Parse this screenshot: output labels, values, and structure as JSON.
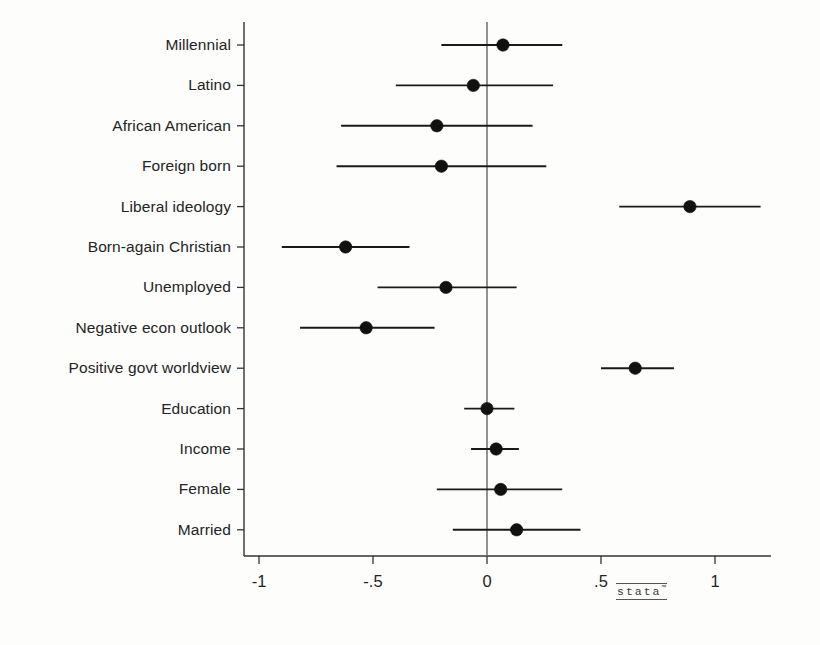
{
  "chart_data": {
    "type": "scatter",
    "subtype": "coefficient-plot-with-confidence-intervals",
    "title": "",
    "subtitle": "",
    "xlabel": "",
    "ylabel": "",
    "xlim": [
      -1.12,
      1.22
    ],
    "xticks": [
      -1,
      -0.5,
      0,
      0.5,
      1
    ],
    "xtick_labels": [
      "-1",
      "-.5",
      "0",
      ".5",
      "1"
    ],
    "grid": false,
    "legend": null,
    "reference_line": 0,
    "categories": [
      "Millennial",
      "Latino",
      "African American",
      "Foreign born",
      "Liberal ideology",
      "Born-again Christian",
      "Unemployed",
      "Negative econ outlook",
      "Positive govt worldview",
      "Education",
      "Income",
      "Female",
      "Married"
    ],
    "estimates": [
      0.07,
      -0.06,
      -0.22,
      -0.2,
      0.89,
      -0.62,
      -0.18,
      -0.53,
      0.65,
      0.0,
      0.04,
      0.06,
      0.13
    ],
    "ci_low": [
      -0.2,
      -0.4,
      -0.64,
      -0.66,
      0.58,
      -0.9,
      -0.48,
      -0.82,
      0.5,
      -0.1,
      -0.07,
      -0.22,
      -0.15
    ],
    "ci_high": [
      0.33,
      0.29,
      0.2,
      0.26,
      1.2,
      -0.34,
      0.13,
      -0.23,
      0.82,
      0.12,
      0.14,
      0.33,
      0.41
    ],
    "points": [
      {
        "label": "Millennial",
        "estimate": 0.07,
        "ci_low": -0.2,
        "ci_high": 0.33
      },
      {
        "label": "Latino",
        "estimate": -0.06,
        "ci_low": -0.4,
        "ci_high": 0.29
      },
      {
        "label": "African American",
        "estimate": -0.22,
        "ci_low": -0.64,
        "ci_high": 0.2
      },
      {
        "label": "Foreign born",
        "estimate": -0.2,
        "ci_low": -0.66,
        "ci_high": 0.26
      },
      {
        "label": "Liberal ideology",
        "estimate": 0.89,
        "ci_low": 0.58,
        "ci_high": 1.2
      },
      {
        "label": "Born-again Christian",
        "estimate": -0.62,
        "ci_low": -0.9,
        "ci_high": -0.34
      },
      {
        "label": "Unemployed",
        "estimate": -0.18,
        "ci_low": -0.48,
        "ci_high": 0.13
      },
      {
        "label": "Negative econ outlook",
        "estimate": -0.53,
        "ci_low": -0.82,
        "ci_high": -0.23
      },
      {
        "label": "Positive govt worldview",
        "estimate": 0.65,
        "ci_low": 0.5,
        "ci_high": 0.82
      },
      {
        "label": "Education",
        "estimate": 0.0,
        "ci_low": -0.1,
        "ci_high": 0.12
      },
      {
        "label": "Income",
        "estimate": 0.04,
        "ci_low": -0.07,
        "ci_high": 0.14
      },
      {
        "label": "Female",
        "estimate": 0.06,
        "ci_low": -0.22,
        "ci_high": 0.33
      },
      {
        "label": "Married",
        "estimate": 0.13,
        "ci_low": -0.15,
        "ci_high": 0.41
      }
    ],
    "marker_color": "#111111",
    "line_color": "#1a1a1a",
    "axis_color": "#333333",
    "reference_line_color": "#6e6e6e"
  },
  "branding": {
    "logo_text": "stata",
    "logo_tm": "™"
  }
}
